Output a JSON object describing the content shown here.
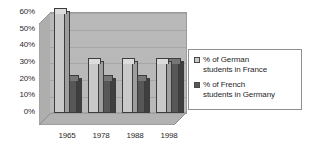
{
  "chart_data": {
    "type": "bar",
    "title": "",
    "xlabel": "",
    "ylabel": "",
    "categories": [
      "1965",
      "1978",
      "1988",
      "1998"
    ],
    "series": [
      {
        "name": "% of German students in France",
        "name_line1": "% of German",
        "name_line2": "students in France",
        "color": "#c9c9c9",
        "values": [
          60,
          30,
          30,
          30
        ]
      },
      {
        "name": "% of French students in Germany",
        "name_line1": "% of French",
        "name_line2": "students in Germany",
        "color": "#575757",
        "values": [
          20,
          20,
          20,
          30
        ]
      }
    ],
    "ylim": [
      0,
      60
    ],
    "yticks": [
      0,
      10,
      20,
      30,
      40,
      50,
      60
    ],
    "ytick_labels": [
      "0%",
      "10%",
      "20%",
      "30%",
      "40%",
      "50%",
      "60%"
    ],
    "grid": true,
    "legend_position": "right",
    "style": "3d-clustered-column"
  },
  "colors": {
    "series_light": "#c9c9c9",
    "series_dark": "#575757",
    "wall": "#b9b9b9",
    "gridline": "#a6a6a6",
    "text": "#2b2b2b",
    "background": "#ffffff"
  }
}
